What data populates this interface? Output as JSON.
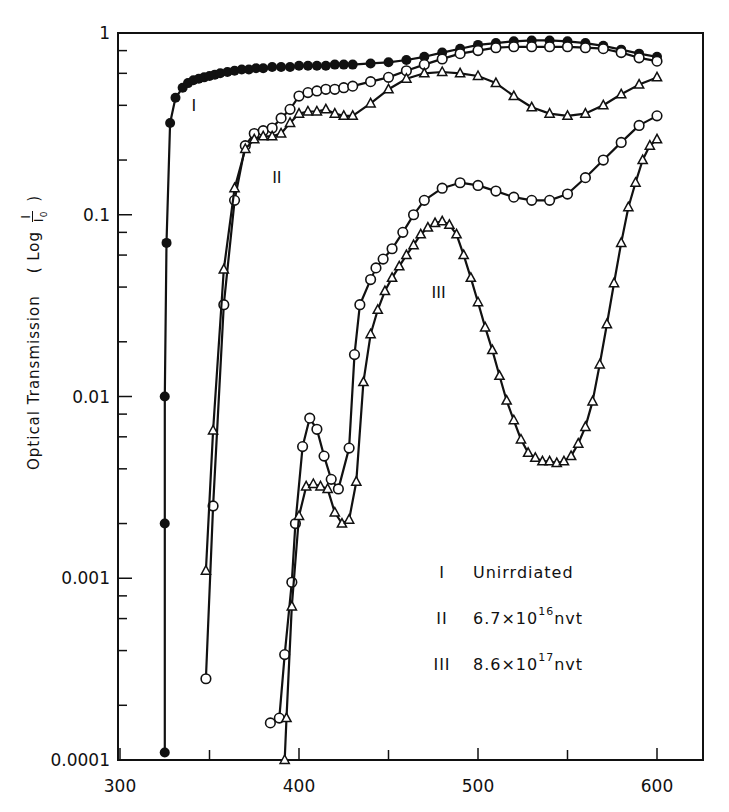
{
  "chart_data": {
    "type": "line",
    "title": "",
    "xlabel": "",
    "ylabel": "Optical Transmission (Log I/I0)",
    "ylabel_parts": {
      "main": "Optical  Transmission",
      "paren": "( Log",
      "frac_num": "I",
      "frac_den": "I",
      "frac_sub": "0",
      "close": ")"
    },
    "xscale": "linear",
    "yscale": "log",
    "xlim": [
      300,
      630
    ],
    "ylim": [
      0.0001,
      1
    ],
    "x_ticks": [
      300,
      400,
      500,
      600
    ],
    "x_minor_ticks": [
      350,
      450,
      550
    ],
    "y_ticks": [
      {
        "value": 1,
        "label": "1"
      },
      {
        "value": 0.1,
        "label": "0.1"
      },
      {
        "value": 0.01,
        "label": "0.01"
      },
      {
        "value": 0.001,
        "label": "0.001"
      },
      {
        "value": 0.0001,
        "label": "0.0001"
      }
    ],
    "grid": false,
    "legend_position": "inside-lower-right",
    "legend": [
      {
        "id": "I",
        "label": "Unirrdiated",
        "base": "",
        "exp": "",
        "unit": ""
      },
      {
        "id": "II",
        "label": "",
        "base": "6.7x10",
        "exp": "16",
        "unit": "nvt"
      },
      {
        "id": "III",
        "label": "",
        "base": "8.6x10",
        "exp": "17",
        "unit": "nvt"
      }
    ],
    "series": [
      {
        "name": "I Unirrdiated",
        "marker": "filled-circle",
        "x": [
          325,
          325,
          325,
          326,
          328,
          331,
          335,
          338,
          341,
          344,
          347,
          350,
          353,
          356,
          360,
          364,
          368,
          372,
          376,
          380,
          385,
          390,
          395,
          400,
          405,
          410,
          415,
          420,
          425,
          430,
          440,
          450,
          460,
          470,
          480,
          490,
          500,
          510,
          520,
          530,
          540,
          550,
          560,
          570,
          580,
          590,
          600
        ],
        "y": [
          0.00011,
          0.002,
          0.01,
          0.07,
          0.32,
          0.44,
          0.5,
          0.53,
          0.55,
          0.56,
          0.57,
          0.58,
          0.59,
          0.6,
          0.61,
          0.62,
          0.63,
          0.63,
          0.64,
          0.64,
          0.65,
          0.65,
          0.65,
          0.66,
          0.66,
          0.66,
          0.66,
          0.67,
          0.67,
          0.67,
          0.68,
          0.69,
          0.71,
          0.74,
          0.78,
          0.82,
          0.86,
          0.88,
          0.9,
          0.91,
          0.91,
          0.9,
          0.88,
          0.85,
          0.81,
          0.77,
          0.74
        ]
      },
      {
        "name": "II circles",
        "marker": "open-circle",
        "x": [
          348,
          352,
          358,
          364,
          370,
          375,
          380,
          385,
          390,
          395,
          400,
          405,
          410,
          415,
          420,
          425,
          430,
          440,
          450,
          460,
          470,
          480,
          490,
          500,
          510,
          520,
          530,
          540,
          550,
          560,
          570,
          580,
          590,
          600
        ],
        "y": [
          0.00028,
          0.0025,
          0.032,
          0.12,
          0.24,
          0.28,
          0.29,
          0.3,
          0.34,
          0.38,
          0.45,
          0.47,
          0.48,
          0.49,
          0.49,
          0.5,
          0.51,
          0.54,
          0.57,
          0.62,
          0.67,
          0.72,
          0.77,
          0.8,
          0.83,
          0.84,
          0.84,
          0.84,
          0.84,
          0.83,
          0.82,
          0.78,
          0.73,
          0.7
        ]
      },
      {
        "name": "II triangles",
        "marker": "open-triangle",
        "x": [
          348,
          352,
          358,
          364,
          370,
          375,
          380,
          385,
          390,
          395,
          400,
          405,
          410,
          415,
          420,
          425,
          430,
          440,
          450,
          460,
          470,
          480,
          490,
          500,
          510,
          520,
          530,
          540,
          550,
          560,
          570,
          580,
          590,
          600
        ],
        "y": [
          0.0011,
          0.0065,
          0.05,
          0.14,
          0.23,
          0.26,
          0.27,
          0.27,
          0.28,
          0.32,
          0.36,
          0.37,
          0.37,
          0.38,
          0.36,
          0.35,
          0.35,
          0.41,
          0.49,
          0.56,
          0.6,
          0.61,
          0.6,
          0.58,
          0.53,
          0.45,
          0.39,
          0.36,
          0.35,
          0.36,
          0.4,
          0.46,
          0.52,
          0.57
        ]
      },
      {
        "name": "III circles",
        "marker": "open-circle",
        "x": [
          384,
          389,
          392,
          396,
          398,
          402,
          406,
          410,
          414,
          418,
          422,
          428,
          431,
          434,
          440,
          443,
          447,
          452,
          458,
          464,
          470,
          480,
          490,
          500,
          510,
          520,
          530,
          540,
          550,
          560,
          570,
          580,
          590,
          600
        ],
        "y": [
          0.00016,
          0.00017,
          0.00038,
          0.00095,
          0.002,
          0.0053,
          0.0076,
          0.0066,
          0.0047,
          0.0035,
          0.0031,
          0.0052,
          0.017,
          0.032,
          0.044,
          0.051,
          0.057,
          0.065,
          0.08,
          0.1,
          0.12,
          0.14,
          0.15,
          0.145,
          0.135,
          0.125,
          0.12,
          0.12,
          0.13,
          0.16,
          0.2,
          0.25,
          0.31,
          0.35
        ]
      },
      {
        "name": "III triangles",
        "marker": "open-triangle",
        "x": [
          392,
          393,
          396,
          400,
          404,
          408,
          412,
          416,
          420,
          424,
          428,
          432,
          436,
          440,
          444,
          448,
          452,
          456,
          460,
          464,
          468,
          472,
          476,
          480,
          484,
          488,
          492,
          496,
          500,
          504,
          508,
          512,
          516,
          520,
          524,
          528,
          532,
          536,
          540,
          544,
          548,
          552,
          556,
          560,
          564,
          568,
          572,
          576,
          580,
          584,
          588,
          592,
          596,
          600
        ],
        "y": [
          0.0001,
          0.00017,
          0.0007,
          0.0022,
          0.0032,
          0.0033,
          0.0032,
          0.0031,
          0.0023,
          0.002,
          0.0021,
          0.0034,
          0.012,
          0.022,
          0.03,
          0.038,
          0.045,
          0.052,
          0.06,
          0.068,
          0.078,
          0.085,
          0.09,
          0.092,
          0.088,
          0.078,
          0.06,
          0.045,
          0.033,
          0.024,
          0.018,
          0.013,
          0.0095,
          0.0074,
          0.0058,
          0.0049,
          0.0046,
          0.0044,
          0.0044,
          0.0043,
          0.0044,
          0.0047,
          0.0055,
          0.0068,
          0.0094,
          0.015,
          0.025,
          0.042,
          0.07,
          0.11,
          0.15,
          0.2,
          0.24,
          0.26
        ]
      }
    ],
    "annotations": [
      {
        "text": "I",
        "x": 340,
        "y": 0.37
      },
      {
        "text": "II",
        "x": 385,
        "y": 0.15
      },
      {
        "text": "III",
        "x": 474,
        "y": 0.035
      }
    ]
  }
}
